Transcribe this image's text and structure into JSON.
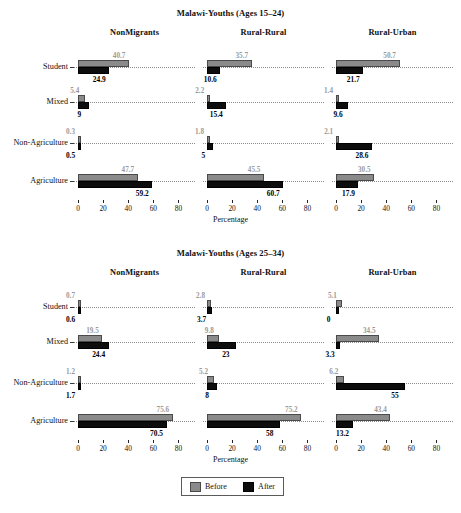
{
  "chart_data": [
    {
      "type": "bar",
      "title": "Malawi-Youths (Ages 15–24)",
      "xlabel": "Percentage",
      "ylabel": "",
      "xlim": [
        0,
        90
      ],
      "xticks": [
        0,
        20,
        40,
        60,
        80
      ],
      "grid": false,
      "orientation": "horizontal",
      "legend": [
        "Before",
        "After"
      ],
      "facets": [
        "NonMigrants",
        "Rural-Rural",
        "Rural-Urban"
      ],
      "categories": [
        "Student",
        "Mixed",
        "Non-Agriculture",
        "Agriculture"
      ],
      "series": [
        {
          "name": "Before",
          "color": "#8a8a8a",
          "values": [
            [
              40.7,
              5.4,
              0.3,
              47.7
            ],
            [
              35.7,
              2.2,
              1.8,
              45.5
            ],
            [
              50.7,
              1.4,
              2.1,
              30.5
            ]
          ]
        },
        {
          "name": "After",
          "color": "#0d0d0d",
          "values": [
            [
              24.9,
              9,
              0.5,
              59.2
            ],
            [
              10.6,
              15.4,
              5,
              60.7
            ],
            [
              21.7,
              9.6,
              28.6,
              17.9
            ]
          ]
        }
      ]
    },
    {
      "type": "bar",
      "title": "Malawi-Youths (Ages 25–34)",
      "xlabel": "Percentage",
      "ylabel": "",
      "xlim": [
        0,
        90
      ],
      "xticks": [
        0,
        20,
        40,
        60,
        80
      ],
      "grid": false,
      "orientation": "horizontal",
      "legend": [
        "Before",
        "After"
      ],
      "facets": [
        "NonMigrants",
        "Rural-Rural",
        "Rural-Urban"
      ],
      "categories": [
        "Student",
        "Mixed",
        "Non-Agriculture",
        "Agriculture"
      ],
      "series": [
        {
          "name": "Before",
          "color": "#8a8a8a",
          "values": [
            [
              0.7,
              19.5,
              1.2,
              75.6
            ],
            [
              2.8,
              9.8,
              5.2,
              75.2
            ],
            [
              5.1,
              34.5,
              6.2,
              43.4
            ]
          ]
        },
        {
          "name": "After",
          "color": "#0d0d0d",
          "values": [
            [
              0.6,
              24.4,
              1.7,
              70.5
            ],
            [
              3.7,
              23,
              8,
              58
            ],
            [
              0,
              3.3,
              55,
              13.2
            ]
          ]
        }
      ]
    }
  ],
  "legend": {
    "before_label": "Before",
    "after_label": "After"
  },
  "colors": {
    "before": "#8a8a8a",
    "after": "#0d0d0d",
    "guide": "#8d8d8d",
    "text": "#101010"
  }
}
